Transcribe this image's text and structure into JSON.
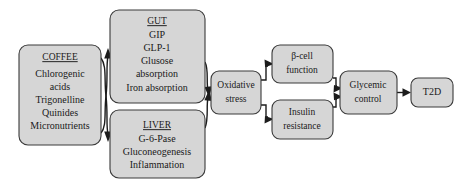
{
  "diagram": {
    "type": "flowchart",
    "colors": {
      "node_fill": "#d6d6d6",
      "node_stroke": "#3a3a3a",
      "arrow": "#1c1c1c",
      "background": "#ffffff",
      "text": "#1a1a1a"
    },
    "nodes": [
      {
        "id": "coffee",
        "name": "coffee-node",
        "heading": "COFFEE",
        "heading_underlined": true,
        "lines": [
          "Chlorogenic",
          "acids",
          "Trigonelline",
          "Quinides",
          "Micronutrients"
        ],
        "x": 19,
        "y": 45,
        "w": 82,
        "h": 100
      },
      {
        "id": "gut",
        "name": "gut-node",
        "heading": "GUT",
        "heading_underlined": true,
        "lines": [
          "GIP",
          "GLP-1",
          "Glusose",
          "absorption",
          "Iron absorption"
        ],
        "x": 110,
        "y": 10,
        "w": 95,
        "h": 93
      },
      {
        "id": "liver",
        "name": "liver-node",
        "heading": "LIVER",
        "heading_underlined": true,
        "lines": [
          "G-6-Pase",
          "Gluconeogenesis",
          "Inflammation"
        ],
        "x": 110,
        "y": 110,
        "w": 95,
        "h": 68
      },
      {
        "id": "oxidative-stress",
        "name": "oxidative-stress-node",
        "heading": "",
        "heading_underlined": false,
        "lines": [
          "Oxidative",
          "stress"
        ],
        "x": 211,
        "y": 71,
        "w": 50,
        "h": 43
      },
      {
        "id": "beta-cell",
        "name": "beta-cell-function-node",
        "heading": "",
        "heading_underlined": false,
        "lines": [
          "β-cell",
          "function"
        ],
        "x": 272,
        "y": 45,
        "w": 61,
        "h": 38
      },
      {
        "id": "insulin-resistance",
        "name": "insulin-resistance-node",
        "heading": "",
        "heading_underlined": false,
        "lines": [
          "Insulin",
          "resistance"
        ],
        "x": 272,
        "y": 100,
        "w": 61,
        "h": 39
      },
      {
        "id": "glycemic-control",
        "name": "glycemic-control-node",
        "heading": "",
        "heading_underlined": false,
        "lines": [
          "Glycemic",
          "control"
        ],
        "x": 340,
        "y": 71,
        "w": 57,
        "h": 43
      },
      {
        "id": "t2d",
        "name": "t2d-node",
        "heading": "",
        "heading_underlined": false,
        "lines": [
          "T2D"
        ],
        "x": 411,
        "y": 78,
        "w": 42,
        "h": 29
      }
    ],
    "edges": [
      {
        "name": "edge-coffee-to-gut",
        "from": "coffee",
        "to": "gut"
      },
      {
        "name": "edge-coffee-to-liver",
        "from": "coffee",
        "to": "liver"
      },
      {
        "name": "edge-gut-to-oxidative-stress",
        "from": "gut",
        "to": "oxidative-stress"
      },
      {
        "name": "edge-liver-to-oxidative-stress",
        "from": "liver",
        "to": "oxidative-stress"
      },
      {
        "name": "edge-oxidative-stress-to-beta-cell",
        "from": "oxidative-stress",
        "to": "beta-cell"
      },
      {
        "name": "edge-oxidative-stress-to-insulin-resistance",
        "from": "oxidative-stress",
        "to": "insulin-resistance"
      },
      {
        "name": "edge-beta-cell-to-glycemic-control",
        "from": "beta-cell",
        "to": "glycemic-control"
      },
      {
        "name": "edge-insulin-resistance-to-glycemic-control",
        "from": "insulin-resistance",
        "to": "glycemic-control"
      },
      {
        "name": "edge-glycemic-control-to-t2d",
        "from": "glycemic-control",
        "to": "t2d"
      }
    ],
    "labels": {
      "coffee_heading": "COFFEE",
      "coffee_l1": "Chlorogenic",
      "coffee_l2": "acids",
      "coffee_l3": "Trigonelline",
      "coffee_l4": "Quinides",
      "coffee_l5": "Micronutrients",
      "gut_heading": "GUT",
      "gut_l1": "GIP",
      "gut_l2": "GLP-1",
      "gut_l3": "Glusose",
      "gut_l4": "absorption",
      "gut_l5": "Iron absorption",
      "liver_heading": "LIVER",
      "liver_l1": "G-6-Pase",
      "liver_l2": "Gluconeogenesis",
      "liver_l3": "Inflammation",
      "oxidative_l1": "Oxidative",
      "oxidative_l2": "stress",
      "beta_l1": "β-cell",
      "beta_l2": "function",
      "insulin_l1": "Insulin",
      "insulin_l2": "resistance",
      "glycemic_l1": "Glycemic",
      "glycemic_l2": "control",
      "t2d_l1": "T2D"
    }
  }
}
